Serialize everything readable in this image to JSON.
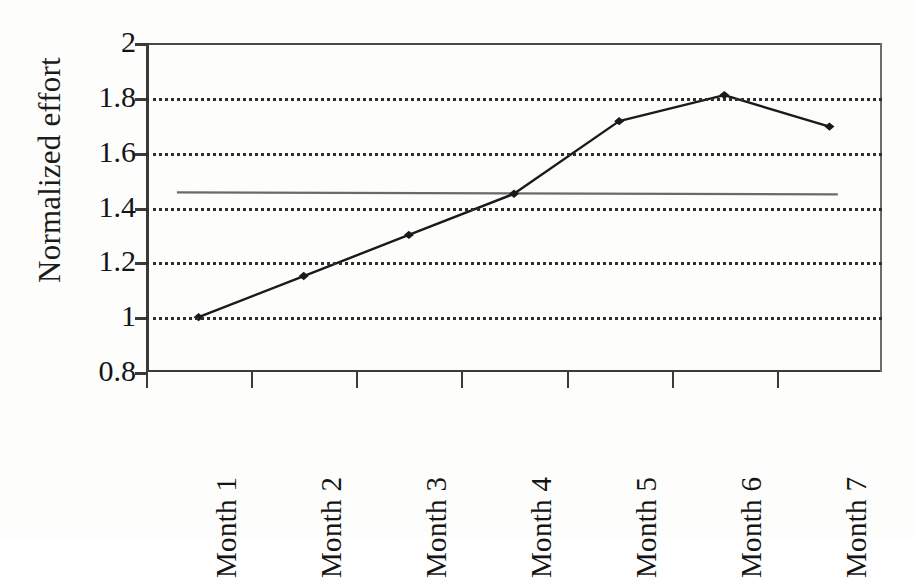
{
  "chart_data": {
    "type": "line",
    "title": "",
    "xlabel": "",
    "ylabel": "Normalized effort",
    "categories": [
      "Month 1",
      "Month 2",
      "Month 3",
      "Month 4",
      "Month 5",
      "Month 6",
      "Month 7"
    ],
    "values": [
      1.0,
      1.15,
      1.3,
      1.45,
      1.715,
      1.81,
      1.695
    ],
    "series": [
      {
        "name": "Normalized effort",
        "values": [
          1.0,
          1.15,
          1.3,
          1.45,
          1.715,
          1.81,
          1.695
        ],
        "marker": "diamond",
        "color": "#1a1a1a"
      }
    ],
    "reference_line": {
      "name": "average-reference-line",
      "value": 1.455,
      "color": "#6a6a6a",
      "orientation": "horizontal",
      "x_start_category_fraction": 0.042,
      "x_end_category_fraction": 0.94
    },
    "ylim": [
      0.8,
      2.0
    ],
    "ytick_values": [
      2,
      1.8,
      1.6,
      1.4,
      1.2,
      1,
      0.8
    ],
    "ytick_labels": [
      "2",
      "1.8",
      "1.6",
      "1.4",
      "1.2",
      "1",
      "0.8"
    ],
    "gridline_values": [
      1.8,
      1.6,
      1.4,
      1.2,
      1.0
    ],
    "grid": "horizontal-dotted",
    "legend": "none",
    "xlabel_rotation": -90
  },
  "axes": {
    "y_title": "Normalized effort"
  }
}
